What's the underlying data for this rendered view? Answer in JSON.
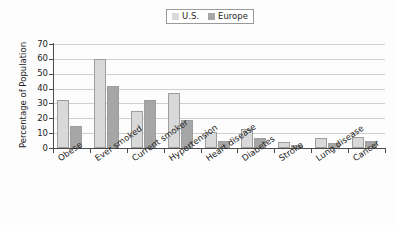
{
  "chart_data": {
    "type": "bar",
    "title": "",
    "xlabel": "",
    "ylabel": "Percentage of Population",
    "ylim": [
      0,
      70
    ],
    "ytick_step": 10,
    "yticks": [
      "70",
      "60",
      "50",
      "40",
      "30",
      "20",
      "10",
      "0"
    ],
    "grid": true,
    "legend_position": "top-center",
    "categories": [
      "Obese",
      "Ever smoked",
      "Current smoker",
      "Hypertension",
      "Heart disease",
      "Diabetes",
      "Stroke",
      "Lung disease",
      "Cancer"
    ],
    "series": [
      {
        "name": "U.S.",
        "color": "#d9d9d9",
        "values": [
          32,
          60,
          25,
          37,
          11,
          13,
          4,
          7,
          7.5
        ]
      },
      {
        "name": "Europe",
        "color": "#a6a6a6",
        "values": [
          15,
          42,
          32,
          19,
          5,
          7,
          2,
          3.5,
          4.5
        ]
      }
    ]
  },
  "legend": {
    "entries": [
      {
        "label": "U.S.",
        "color": "#d9d9d9"
      },
      {
        "label": "Europe",
        "color": "#a6a6a6"
      }
    ]
  },
  "axes": {
    "y_title": "Percentage of Population"
  },
  "colors": {
    "us_bar": "#d9d9d9",
    "europe_bar": "#a6a6a6",
    "bar_border": "#9e9e9e",
    "axis": "#4a4a4a",
    "gridline": "#cfcfcf",
    "background": "#fdfdfd",
    "text": "#232323"
  }
}
